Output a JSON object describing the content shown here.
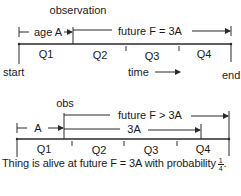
{
  "top_diagram": {
    "observation_label": "observation",
    "age_label": "age A",
    "future_label": "future F = 3A",
    "quarters": [
      "Q1",
      "Q2",
      "Q3",
      "Q4"
    ],
    "start_label": "start",
    "time_label": "time",
    "end_label": "end"
  },
  "bottom_diagram": {
    "obs_label": "obs",
    "age_label": "A",
    "future_label": "future F > 3A",
    "three_a_label": "3A",
    "quarters": [
      "Q1",
      "Q2",
      "Q3",
      "Q4"
    ]
  },
  "caption": {
    "text": "Thing is alive at future F = 3A with probability",
    "fraction_numerator": "1",
    "fraction_denominator": "4",
    "end_punct": "."
  }
}
